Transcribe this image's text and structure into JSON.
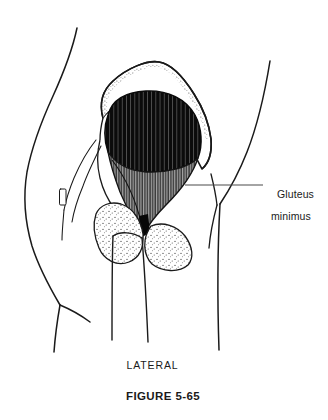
{
  "figure": {
    "caption": "FIGURE 5-65",
    "orientation_label": "LATERAL",
    "background_color": "#ffffff",
    "ink_color": "#1a1a1a"
  },
  "callout": {
    "line1": "Gluteus",
    "line2": "minimus",
    "full_text": "Gluteus minimus",
    "leader_line": {
      "from_x": 185,
      "from_y": 185,
      "to_x": 263,
      "to_y": 185,
      "color": "#4a4a4a"
    }
  },
  "anatomy": {
    "title": "Lateral view of hip showing gluteus minimus",
    "structures": [
      {
        "name": "body-contour-left",
        "kind": "outline",
        "color": "#1a1a1a"
      },
      {
        "name": "body-contour-right",
        "kind": "outline",
        "color": "#1a1a1a"
      },
      {
        "name": "gluteal-fold",
        "kind": "outline",
        "color": "#1a1a1a"
      },
      {
        "name": "ilium",
        "kind": "bone",
        "texture": "stipple",
        "color": "#ffffff"
      },
      {
        "name": "iliac-crest",
        "kind": "bone-edge",
        "texture": "stipple"
      },
      {
        "name": "greater-trochanter",
        "kind": "bone",
        "texture": "stipple"
      },
      {
        "name": "ischial-tuberosity",
        "kind": "bone",
        "texture": "stipple"
      },
      {
        "name": "femur-shaft",
        "kind": "bone",
        "texture": "outline"
      },
      {
        "name": "gluteus-minimus-belly",
        "kind": "muscle",
        "color": "#0d0d0d",
        "texture": "striated"
      },
      {
        "name": "gluteus-minimus-tendon",
        "kind": "muscle",
        "color": "#555555",
        "texture": "fine-striated"
      },
      {
        "name": "anterior-pelvic-outline",
        "kind": "outline"
      }
    ]
  }
}
